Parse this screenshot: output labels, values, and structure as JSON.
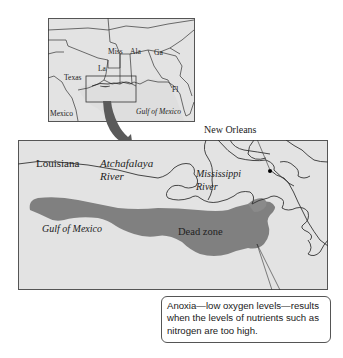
{
  "colors": {
    "land": "#e3e3e3",
    "water": "#dcdcdc",
    "border": "#555555",
    "dead_zone": "#7a7a7a",
    "arrow": "#5a5a5a",
    "background": "#ffffff"
  },
  "inset_map": {
    "labels": {
      "texas": "Texas",
      "la": "La",
      "miss": "Miss",
      "ala": "Ala",
      "ga": "Ga",
      "fl": "Fl",
      "mexico": "Mexico",
      "gulf": "Gulf of Mexico"
    }
  },
  "main_map": {
    "labels": {
      "louisiana": "Louisiana",
      "atchafalaya_line1": "Atchafalaya",
      "atchafalaya_line2": "River",
      "mississippi_line1": "Mississippi",
      "mississippi_line2": "River",
      "new_orleans": "New Orleans",
      "gulf": "Gulf of Mexico",
      "dead_zone": "Dead zone"
    }
  },
  "callout": {
    "text": "Anoxia—low oxygen levels—results when the levels of nutrients such as nitrogen are too high."
  }
}
